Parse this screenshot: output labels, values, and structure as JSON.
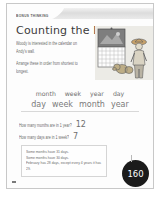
{
  "page": {
    "banner_label": "BONUS THINKING",
    "title": "Counting the Days",
    "page_number": "160"
  },
  "intro": {
    "paragraph_1": "Woody is interested in the calendar on Andy's wall.",
    "paragraph_2": "Arrange these in order from shortest to longest."
  },
  "ordering": {
    "given_words": [
      "month",
      "week",
      "year",
      "day"
    ],
    "answer_words": [
      "day",
      "week",
      "month",
      "year"
    ]
  },
  "questions": [
    {
      "text": "How many months are in 1 year?",
      "answer": "12"
    },
    {
      "text": "How many days are in 1 week?",
      "answer": "7"
    }
  ],
  "facts": {
    "line_1": "Some months have 31 days.",
    "line_2": "Some months have 30 days.",
    "line_3": "February has 28 days, except every 4 years it has 29."
  },
  "artwork": {
    "name": "woody-slinky-calendar-illustration",
    "colors": {
      "wall": "#e6e3dc",
      "calendar_photo": "#8d8d8d",
      "calendar_grid": "#ffffff",
      "woody_hat": "#c9a063",
      "woody_shirt": "#d8d2c4",
      "slinky": "#b9a77f",
      "outline": "#5e5e5e"
    }
  }
}
